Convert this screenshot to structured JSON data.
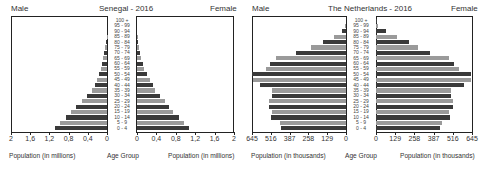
{
  "chart_data": [
    {
      "type": "bar",
      "subtype": "population-pyramid",
      "title": "Senegal - 2016",
      "left_label": "Male",
      "right_label": "Female",
      "xlabel_left": "Population (in millions)",
      "xlabel_right": "Population (in millions)",
      "center_label": "Age Group",
      "xticks": [
        "2",
        "1,6",
        "1,2",
        "0,8",
        "0,4",
        "0"
      ],
      "xticks_right": [
        "0",
        "0,4",
        "0,8",
        "1,2",
        "1,6",
        "2"
      ],
      "xlim": [
        0,
        2
      ],
      "categories": [
        "100 +",
        "95 - 99",
        "90 - 94",
        "85 - 89",
        "80 - 84",
        "75 - 79",
        "70 - 74",
        "65 - 69",
        "60 - 64",
        "55 - 59",
        "50 - 54",
        "45 - 49",
        "40 - 44",
        "35 - 39",
        "30 - 34",
        "25 - 29",
        "20 - 24",
        "15 - 19",
        "10 - 14",
        "5 - 9",
        "0 - 4"
      ],
      "series": [
        {
          "name": "Male",
          "values": [
            0.0,
            0.0,
            0.0,
            0.01,
            0.02,
            0.04,
            0.06,
            0.08,
            0.11,
            0.13,
            0.17,
            0.21,
            0.26,
            0.32,
            0.42,
            0.53,
            0.65,
            0.75,
            0.86,
            0.97,
            1.08
          ]
        },
        {
          "name": "Female",
          "values": [
            0.0,
            0.0,
            0.0,
            0.01,
            0.03,
            0.04,
            0.07,
            0.09,
            0.13,
            0.15,
            0.2,
            0.27,
            0.32,
            0.38,
            0.48,
            0.58,
            0.67,
            0.75,
            0.86,
            0.97,
            1.08
          ]
        }
      ]
    },
    {
      "type": "bar",
      "subtype": "population-pyramid",
      "title": "The Netherlands - 2016",
      "left_label": "Male",
      "right_label": "Female",
      "xlabel_left": "Population (in thousands)",
      "xlabel_right": "Population (in thousands)",
      "center_label": "Age Group",
      "xticks": [
        "645",
        "516",
        "387",
        "258",
        "129",
        "0"
      ],
      "xticks_right": [
        "0",
        "129",
        "258",
        "387",
        "516",
        "645"
      ],
      "xlim": [
        0,
        645
      ],
      "categories": [
        "100 +",
        "95 - 99",
        "90 - 94",
        "85 - 89",
        "80 - 84",
        "75 - 79",
        "70 - 74",
        "65 - 69",
        "60 - 64",
        "55 - 59",
        "50 - 54",
        "45 - 49",
        "40 - 44",
        "35 - 39",
        "30 - 34",
        "25 - 29",
        "20 - 24",
        "15 - 19",
        "10 - 14",
        "5 - 9",
        "0 - 4"
      ],
      "series": [
        {
          "name": "Male",
          "values": [
            0,
            5,
            30,
            80,
            155,
            240,
            345,
            480,
            520,
            550,
            645,
            640,
            590,
            505,
            505,
            525,
            530,
            505,
            515,
            455,
            445
          ]
        },
        {
          "name": "Female",
          "values": [
            2,
            15,
            70,
            140,
            220,
            285,
            360,
            490,
            525,
            555,
            635,
            635,
            590,
            505,
            505,
            520,
            520,
            490,
            495,
            445,
            430
          ]
        }
      ]
    }
  ]
}
